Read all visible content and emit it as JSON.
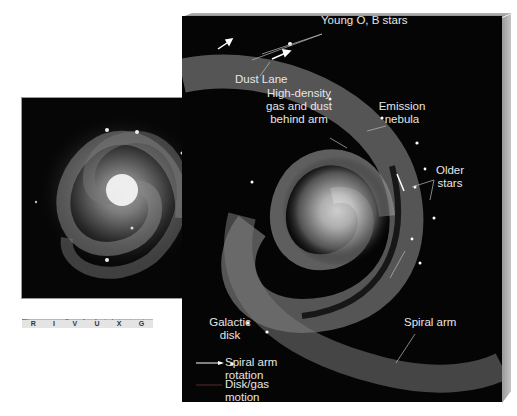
{
  "diagram": {
    "labels": {
      "young_stars": "Young O, B stars",
      "dust_lane": "Dust Lane",
      "high_density": [
        "High-density",
        "gas and dust",
        "behind arm"
      ],
      "emission_nebula": [
        "Emission",
        "nebula"
      ],
      "older_stars": [
        "Older",
        "stars"
      ],
      "galactic_disk": [
        "Galactic",
        "disk"
      ],
      "spiral_arm": "Spiral arm"
    },
    "legend": [
      {
        "label": [
          "Spiral arm",
          "rotation"
        ],
        "color": "#ffffff"
      },
      {
        "label": [
          "Disk/gas",
          "motion"
        ],
        "color": "#5a2a2a"
      }
    ],
    "spectrum": {
      "bands": [
        "R",
        "I",
        "V",
        "U",
        "X",
        "G"
      ],
      "highlighted": "V"
    }
  }
}
